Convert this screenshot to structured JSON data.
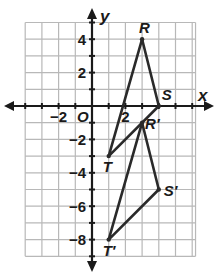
{
  "diagram": {
    "type": "coordinate-plane",
    "axes": {
      "x_label": "x",
      "y_label": "y",
      "origin_label": "O",
      "x_range": [
        -4,
        6
      ],
      "y_range": [
        -9,
        5
      ],
      "x_ticks": [
        {
          "value": -2,
          "label": "−2"
        },
        {
          "value": 2,
          "label": "2"
        }
      ],
      "y_ticks": [
        {
          "value": 4,
          "label": "4"
        },
        {
          "value": 2,
          "label": "2"
        },
        {
          "value": -2,
          "label": "−2"
        },
        {
          "value": -4,
          "label": "−4"
        },
        {
          "value": -6,
          "label": "−6"
        },
        {
          "value": -8,
          "label": "−8"
        }
      ]
    },
    "triangles": [
      {
        "name": "RST",
        "points": [
          {
            "label": "R",
            "x": 3,
            "y": 4
          },
          {
            "label": "S",
            "x": 4,
            "y": 0
          },
          {
            "label": "T",
            "x": 1,
            "y": -3
          }
        ]
      },
      {
        "name": "R'S'T'",
        "points": [
          {
            "label": "R′",
            "x": 3,
            "y": -1
          },
          {
            "label": "S′",
            "x": 4,
            "y": -5
          },
          {
            "label": "T′",
            "x": 1,
            "y": -8
          }
        ]
      }
    ],
    "colors": {
      "grid": "#b8b8b8",
      "axis": "#1a1a1a",
      "triangle": "#2a2a2a",
      "background": "#ffffff"
    }
  }
}
